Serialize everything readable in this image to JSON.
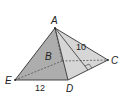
{
  "figure": {
    "type": "square pyramid",
    "vertices": {
      "A": {
        "label": "A",
        "x": 55,
        "y": 28
      },
      "B": {
        "label": "B",
        "x": 62,
        "y": 61
      },
      "C": {
        "label": "C",
        "x": 108,
        "y": 60
      },
      "D": {
        "label": "D",
        "x": 68,
        "y": 80
      },
      "E": {
        "label": "E",
        "x": 15,
        "y": 80
      }
    },
    "slant_foot": {
      "x": 88,
      "y": 70
    },
    "measurements": {
      "base_edge": "12",
      "slant_height": "10"
    },
    "colors": {
      "face_front": "#a9a9a9",
      "face_left": "#c8c8c8",
      "face_right": "#d2d2d2",
      "edge": "#333333"
    }
  }
}
